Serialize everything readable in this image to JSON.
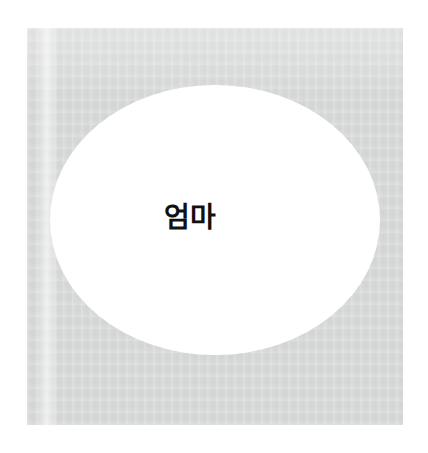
{
  "image": {
    "kind": "scanned-book-page",
    "background_color": "#ffffff",
    "canvas": {
      "width": 428,
      "height": 453
    }
  },
  "paper_panel": {
    "name": "gray-paper-panel",
    "fill_color": "#d7d8d8",
    "bounds": {
      "x": 27,
      "y": 28,
      "width": 376,
      "height": 397
    }
  },
  "fold_band": {
    "name": "vertical-fold-band",
    "description": "faint lighter vertical crease near the left edge of the page"
  },
  "ellipse": {
    "name": "white-ellipse",
    "fill_color": "#ffffff",
    "bounds": {
      "x": 50,
      "y": 85,
      "width": 330,
      "height": 270
    },
    "label": "엄마",
    "label_color": "#111111",
    "label_weight": "bold",
    "label_size_px": 28
  }
}
